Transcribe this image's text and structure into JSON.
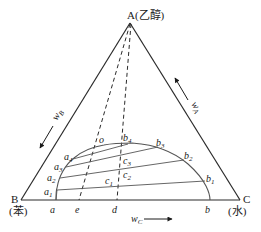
{
  "diagram": {
    "type": "ternary-phase-diagram",
    "vertices": {
      "A": {
        "letter": "A",
        "name": "(乙醇)"
      },
      "B": {
        "letter": "B",
        "name": "(苯)"
      },
      "C": {
        "letter": "C",
        "name": "(水)"
      }
    },
    "axes": {
      "wA": {
        "base": "w",
        "sub": "A"
      },
      "wB": {
        "base": "w",
        "sub": "B"
      },
      "wC": {
        "base": "w",
        "sub": "C"
      }
    },
    "points": {
      "a": {
        "base": "a",
        "sub": ""
      },
      "e": {
        "base": "e",
        "sub": ""
      },
      "d": {
        "base": "d",
        "sub": ""
      },
      "b": {
        "base": "b",
        "sub": ""
      },
      "o": {
        "base": "o",
        "sub": ""
      },
      "a1": {
        "base": "a",
        "sub": "1"
      },
      "a2": {
        "base": "a",
        "sub": "2"
      },
      "a3": {
        "base": "a",
        "sub": "3"
      },
      "a4": {
        "base": "a",
        "sub": "4"
      },
      "b1": {
        "base": "b",
        "sub": "1"
      },
      "b2": {
        "base": "b",
        "sub": "2"
      },
      "b3": {
        "base": "b",
        "sub": "3"
      },
      "b4": {
        "base": "b",
        "sub": "4"
      },
      "c1": {
        "base": "c",
        "sub": "1"
      },
      "c2": {
        "base": "c",
        "sub": "2"
      },
      "c3": {
        "base": "c",
        "sub": "3"
      }
    },
    "tie_lines": [
      {
        "from": "a1",
        "to": "b1",
        "through": "c1"
      },
      {
        "from": "a2",
        "to": "b2",
        "through": "c2"
      },
      {
        "from": "a3",
        "to": "b3",
        "through": "c3"
      },
      {
        "from": "a4",
        "to": "b4",
        "through": ""
      }
    ],
    "dashed_lines": [
      {
        "from": "A",
        "to": "e",
        "through": "o"
      },
      {
        "from": "A",
        "to": "d",
        "through": "c1, c2, c3"
      }
    ],
    "binodal_curve": [
      "a",
      "a1",
      "a2",
      "a3",
      "a4",
      "o",
      "b4",
      "b3",
      "b2",
      "b1",
      "b"
    ]
  }
}
